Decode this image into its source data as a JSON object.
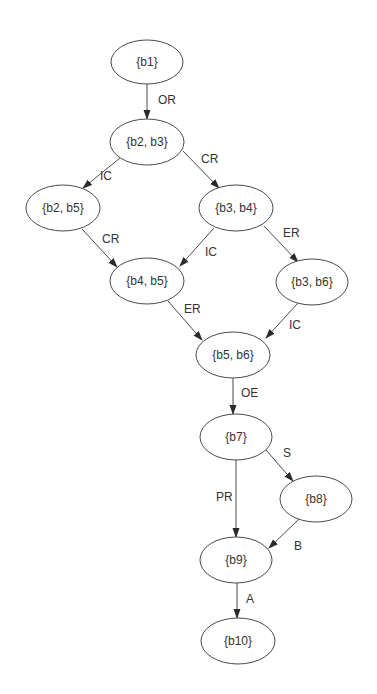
{
  "diagram": {
    "type": "directed-graph",
    "colors": {
      "background": "#ffffff",
      "stroke": "#4a4a4a",
      "text": "#333333",
      "arrowhead": "#2a2a2a"
    },
    "nodes": [
      {
        "id": "n1",
        "label": "{b1}",
        "cx": 147,
        "cy": 62,
        "rx": 36,
        "ry": 22
      },
      {
        "id": "n2",
        "label": "{b2, b3}",
        "cx": 147,
        "cy": 142,
        "rx": 37,
        "ry": 23
      },
      {
        "id": "n3",
        "label": "{b2, b5}",
        "cx": 63,
        "cy": 208,
        "rx": 37,
        "ry": 23
      },
      {
        "id": "n4",
        "label": "{b3, b4}",
        "cx": 236,
        "cy": 208,
        "rx": 37,
        "ry": 23
      },
      {
        "id": "n5",
        "label": "{b4, b5}",
        "cx": 147,
        "cy": 281,
        "rx": 37,
        "ry": 23
      },
      {
        "id": "n6",
        "label": "{b3, b6}",
        "cx": 312,
        "cy": 282,
        "rx": 36,
        "ry": 23
      },
      {
        "id": "n7",
        "label": "{b5, b6}",
        "cx": 233,
        "cy": 355,
        "rx": 37,
        "ry": 23
      },
      {
        "id": "n8",
        "label": "{b7}",
        "cx": 236,
        "cy": 437,
        "rx": 36,
        "ry": 23
      },
      {
        "id": "n9",
        "label": "{b8}",
        "cx": 316,
        "cy": 499,
        "rx": 36,
        "ry": 23
      },
      {
        "id": "n10",
        "label": "{b9}",
        "cx": 236,
        "cy": 560,
        "rx": 36,
        "ry": 23
      },
      {
        "id": "n11",
        "label": "{b10}",
        "cx": 238,
        "cy": 641,
        "rx": 37,
        "ry": 23
      }
    ],
    "edges": [
      {
        "from": "n1",
        "to": "n2",
        "label": "OR",
        "x1": 147,
        "y1": 84,
        "x2": 147,
        "y2": 119,
        "lx": 158,
        "ly": 104
      },
      {
        "from": "n2",
        "to": "n3",
        "label": "IC",
        "x1": 120,
        "y1": 158,
        "x2": 83,
        "y2": 188,
        "lx": 100,
        "ly": 180
      },
      {
        "from": "n2",
        "to": "n4",
        "label": "CR",
        "x1": 183,
        "y1": 151,
        "x2": 219,
        "y2": 188,
        "lx": 201,
        "ly": 163
      },
      {
        "from": "n3",
        "to": "n5",
        "label": "CR",
        "x1": 82,
        "y1": 229,
        "x2": 117,
        "y2": 267,
        "lx": 102,
        "ly": 243
      },
      {
        "from": "n4",
        "to": "n5",
        "label": "IC",
        "x1": 214,
        "y1": 228,
        "x2": 180,
        "y2": 266,
        "lx": 205,
        "ly": 256
      },
      {
        "from": "n4",
        "to": "n6",
        "label": "ER",
        "x1": 264,
        "y1": 226,
        "x2": 298,
        "y2": 262,
        "lx": 283,
        "ly": 237
      },
      {
        "from": "n5",
        "to": "n7",
        "label": "ER",
        "x1": 168,
        "y1": 301,
        "x2": 202,
        "y2": 340,
        "lx": 184,
        "ly": 313
      },
      {
        "from": "n6",
        "to": "n7",
        "label": "IC",
        "x1": 298,
        "y1": 303,
        "x2": 266,
        "y2": 338,
        "lx": 289,
        "ly": 329
      },
      {
        "from": "n7",
        "to": "n8",
        "label": "OE",
        "x1": 233,
        "y1": 378,
        "x2": 233,
        "y2": 414,
        "lx": 241,
        "ly": 397
      },
      {
        "from": "n8",
        "to": "n9",
        "label": "S",
        "x1": 266,
        "y1": 450,
        "x2": 293,
        "y2": 481,
        "lx": 283,
        "ly": 457
      },
      {
        "from": "n8",
        "to": "n10",
        "label": "PR",
        "x1": 236,
        "y1": 460,
        "x2": 236,
        "y2": 537,
        "lx": 216,
        "ly": 501
      },
      {
        "from": "n9",
        "to": "n10",
        "label": "B",
        "x1": 299,
        "y1": 519,
        "x2": 269,
        "y2": 548,
        "lx": 294,
        "ly": 550
      },
      {
        "from": "n10",
        "to": "n11",
        "label": "A",
        "x1": 237,
        "y1": 583,
        "x2": 237,
        "y2": 618,
        "lx": 246,
        "ly": 603
      }
    ]
  }
}
